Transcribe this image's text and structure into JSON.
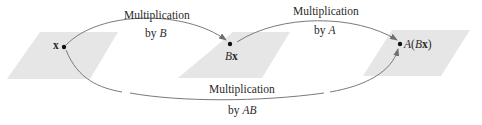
{
  "diagram": {
    "planes": [
      {
        "name": "domain-plane",
        "fill": "#e6e6e6"
      },
      {
        "name": "middle-plane",
        "fill": "#e6e6e6"
      },
      {
        "name": "codomain-plane",
        "fill": "#e6e6e6"
      }
    ],
    "points": {
      "x": {
        "label": "x"
      },
      "bx": {
        "label_italic": "B",
        "label_bold": "x"
      },
      "abx": {
        "prefix": "A(",
        "label_italic": "B",
        "label_bold": "x",
        "suffix": ")"
      }
    },
    "arrows": {
      "by_b": {
        "line1": "Multiplication",
        "line2_prefix": "by ",
        "line2_var": "B"
      },
      "by_a": {
        "line1": "Multiplication",
        "line2_prefix": "by ",
        "line2_var": "A"
      },
      "by_ab": {
        "line1": "Multiplication",
        "line2_prefix": "by ",
        "line2_var": "AB"
      }
    },
    "colors": {
      "arrow": "#7a7a7a",
      "dot": "#111111",
      "plane": "#e6e6e6"
    }
  }
}
